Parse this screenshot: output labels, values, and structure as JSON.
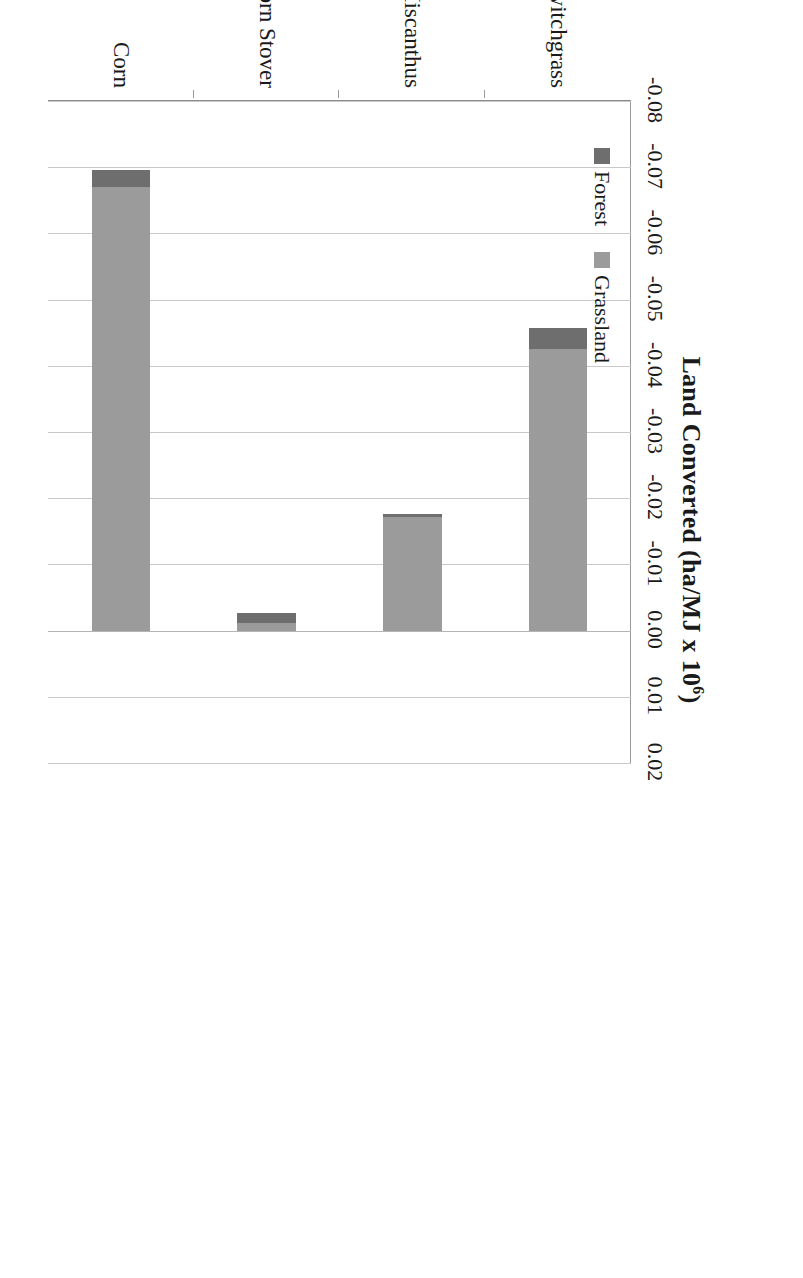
{
  "chart_data": {
    "type": "bar",
    "orientation": "horizontal-stacked",
    "title": "Land Converted (ha/MJ x 10",
    "title_exponent": "6",
    "title_suffix": ")",
    "xlabel": "Land Converted (ha/MJ x 10^6)",
    "ylabel": "",
    "xlim": [
      -0.08,
      0.02
    ],
    "xtick_labels": [
      "-0.08",
      "-0.07",
      "-0.06",
      "-0.05",
      "-0.04",
      "-0.03",
      "-0.02",
      "-0.01",
      "0.00",
      "0.01",
      "0.02"
    ],
    "xticks": [
      -0.08,
      -0.07,
      -0.06,
      -0.05,
      -0.04,
      -0.03,
      -0.02,
      -0.01,
      0.0,
      0.01,
      0.02
    ],
    "grid": true,
    "legend_position": "top-left-inside",
    "categories": [
      "Switchgrass",
      "Miscanthus",
      "Corn Stover",
      "Corn"
    ],
    "series": [
      {
        "name": "Grassland",
        "color": "#9b9b9b",
        "values": [
          -0.0425,
          -0.0172,
          -0.0012,
          -0.067
        ]
      },
      {
        "name": "Forest",
        "color": "#6e6e6e",
        "values": [
          -0.0032,
          -0.0004,
          -0.0015,
          -0.0026
        ]
      }
    ],
    "bar_totals": [
      -0.0457,
      -0.0176,
      -0.0027,
      -0.0696
    ],
    "colors": {
      "grassland": "#9b9b9b",
      "forest": "#6e6e6e",
      "gridline": "#c9c9c9",
      "axis": "#8a8a8a",
      "text": "#1a1a1a",
      "background": "#ffffff"
    }
  }
}
